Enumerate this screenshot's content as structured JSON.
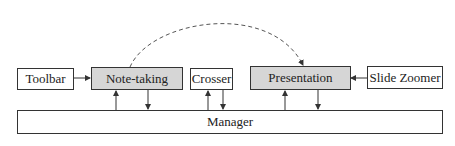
{
  "diagram": {
    "nodes": [
      {
        "id": "toolbar",
        "label": "Toolbar",
        "highlight": false
      },
      {
        "id": "note-taking",
        "label": "Note-taking",
        "highlight": true
      },
      {
        "id": "crosser",
        "label": "Crosser",
        "highlight": false
      },
      {
        "id": "presentation",
        "label": "Presentation",
        "highlight": true
      },
      {
        "id": "slide-zoomer",
        "label": "Slide Zoomer",
        "highlight": false
      },
      {
        "id": "manager",
        "label": "Manager",
        "highlight": false
      }
    ],
    "edges": [
      {
        "from": "toolbar",
        "to": "note-taking",
        "style": "solid"
      },
      {
        "from": "slide-zoomer",
        "to": "presentation",
        "style": "solid"
      },
      {
        "from": "note-taking",
        "to": "presentation",
        "style": "dashed-arc"
      },
      {
        "from": "manager",
        "to": "note-taking",
        "style": "solid"
      },
      {
        "from": "note-taking",
        "to": "manager",
        "style": "solid"
      },
      {
        "from": "manager",
        "to": "crosser",
        "style": "solid"
      },
      {
        "from": "crosser",
        "to": "manager",
        "style": "solid"
      },
      {
        "from": "manager",
        "to": "presentation",
        "style": "solid"
      },
      {
        "from": "presentation",
        "to": "manager",
        "style": "solid"
      }
    ],
    "colors": {
      "highlight_fill": "#d6d6d6",
      "stroke": "#333333"
    }
  }
}
